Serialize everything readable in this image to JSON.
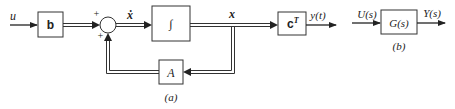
{
  "diagram_a": {
    "caption": "(a)",
    "input_label": "u",
    "gain_b": "b",
    "sum_signs": [
      "+",
      "+"
    ],
    "state_derivative": "ẋ",
    "integrator": "∫",
    "state": "x",
    "output_gain": "cT",
    "output_gain_base": "c",
    "output_gain_sup": "T",
    "output_label": "y(t)",
    "feedback_gain": "A"
  },
  "diagram_b": {
    "caption": "(b)",
    "input_label": "U(s)",
    "transfer_function": "G(s)",
    "output_label": "Y(s)"
  }
}
